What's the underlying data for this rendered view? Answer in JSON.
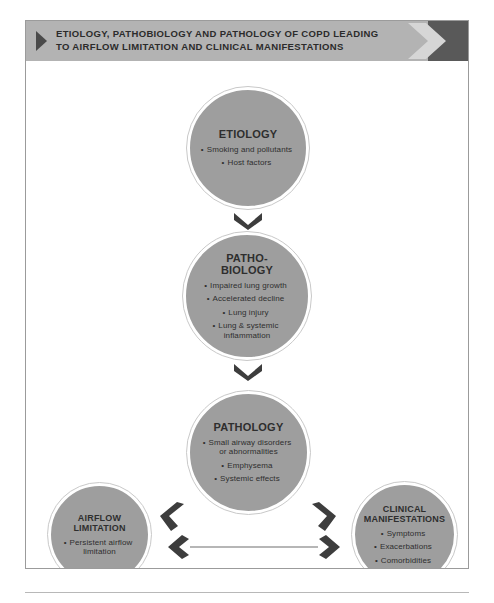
{
  "banner": {
    "title": "ETIOLOGY, PATHOBIOLOGY AND PATHOLOGY OF COPD LEADING\nTO AIRFLOW LIMITATION AND CLINICAL MANIFESTATIONS",
    "bullet_icon": "triangle-right-icon",
    "end_icon": "chevron-right-icon",
    "background_color": "#b3b3b3",
    "end_block_color": "#595959"
  },
  "diagram": {
    "node_fill_color": "#9e9e9e",
    "arrow_color": "#3d3d3d",
    "nodes": [
      {
        "id": "etiology",
        "title": "ETIOLOGY",
        "items": [
          "Smoking and pollutants",
          "Host factors"
        ]
      },
      {
        "id": "pathobiology",
        "title": "PATHO-\nBIOLOGY",
        "items": [
          "Impaired lung growth",
          "Accelerated decline",
          "Lung injury",
          "Lung & systemic\ninflammation"
        ]
      },
      {
        "id": "pathology",
        "title": "PATHOLOGY",
        "items": [
          "Small airway disorders\nor abnormalities",
          "Emphysema",
          "Systemic effects"
        ]
      },
      {
        "id": "airflow-limitation",
        "title": "AIRFLOW\nLIMITATION",
        "items": [
          "Persistent airflow\nlimitation"
        ]
      },
      {
        "id": "clinical-manifestations",
        "title": "CLINICAL\nMANIFESTATIONS",
        "items": [
          "Symptoms",
          "Exacerbations",
          "Comorbidities"
        ]
      }
    ],
    "arrows": [
      {
        "id": "etiology-to-pathobiology",
        "icon": "chevron-down-icon"
      },
      {
        "id": "pathobiology-to-pathology",
        "icon": "chevron-down-icon"
      },
      {
        "id": "pathology-to-airflow",
        "icon": "chevron-down-left-icon"
      },
      {
        "id": "pathology-to-clinical",
        "icon": "chevron-down-right-icon"
      },
      {
        "id": "airflow-clinical-bidirectional",
        "icon": "double-headed-arrow-icon"
      }
    ]
  }
}
